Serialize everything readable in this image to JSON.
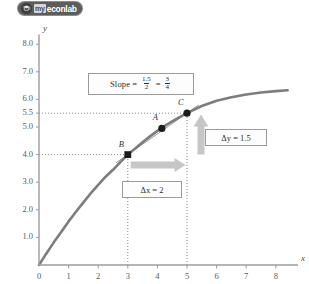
{
  "logo": {
    "icon": "graduation-cap-icon",
    "prefix": "my",
    "name": "econlab"
  },
  "chart_data": {
    "type": "line",
    "title": "",
    "xlabel": "x",
    "ylabel": "y",
    "xlim": [
      0,
      8.6
    ],
    "ylim": [
      0,
      8.4
    ],
    "xticks": [
      "0",
      "1",
      "2",
      "3",
      "4",
      "5",
      "6",
      "7",
      "8"
    ],
    "xtick_values": [
      0,
      1,
      2,
      3,
      4,
      5,
      6,
      7,
      8
    ],
    "yticks": [
      "1.0",
      "2.0",
      "3.0",
      "4.0",
      "5.0",
      "5.5",
      "6.0",
      "7.0",
      "8.0"
    ],
    "ytick_values": [
      1.0,
      2.0,
      3.0,
      4.0,
      5.0,
      5.5,
      6.0,
      7.0,
      8.0
    ],
    "grid": false,
    "curve_color": "#7d7d7d",
    "secant_color": "#9a9a9a",
    "arrow_color": "#c6c6c6",
    "dotted_color": "#8c8c8c",
    "series": [
      {
        "name": "curve",
        "points": [
          [
            0.0,
            0.0
          ],
          [
            0.25,
            0.42
          ],
          [
            0.5,
            0.82
          ],
          [
            0.75,
            1.2
          ],
          [
            1.0,
            1.58
          ],
          [
            1.25,
            1.93
          ],
          [
            1.5,
            2.27
          ],
          [
            1.75,
            2.6
          ],
          [
            2.0,
            2.9
          ],
          [
            2.25,
            3.2
          ],
          [
            2.5,
            3.45
          ],
          [
            2.75,
            3.73
          ],
          [
            3.0,
            4.0
          ],
          [
            3.25,
            4.22
          ],
          [
            3.5,
            4.45
          ],
          [
            3.75,
            4.66
          ],
          [
            4.0,
            4.86
          ],
          [
            4.25,
            5.04
          ],
          [
            4.5,
            5.2
          ],
          [
            4.75,
            5.36
          ],
          [
            5.0,
            5.5
          ],
          [
            5.5,
            5.76
          ],
          [
            6.0,
            5.95
          ],
          [
            6.5,
            6.08
          ],
          [
            7.0,
            6.18
          ],
          [
            7.5,
            6.25
          ],
          [
            8.0,
            6.3
          ],
          [
            8.4,
            6.33
          ]
        ]
      },
      {
        "name": "secant-line-B-to-C",
        "points": [
          [
            2.6,
            3.7
          ],
          [
            5.4,
            5.8
          ]
        ]
      }
    ],
    "annotations": [
      {
        "label": "A",
        "x": 4.15,
        "y": 4.95,
        "marker": "dot"
      },
      {
        "label": "B",
        "x": 3.0,
        "y": 4.0,
        "marker": "square"
      },
      {
        "label": "C",
        "x": 5.0,
        "y": 5.5,
        "marker": "dot"
      }
    ],
    "dashed_guides": [
      {
        "from": [
          0,
          4.0
        ],
        "to": [
          3.0,
          4.0
        ]
      },
      {
        "from": [
          0,
          5.5
        ],
        "to": [
          5.0,
          5.5
        ]
      },
      {
        "from": [
          3.0,
          0
        ],
        "to": [
          3.0,
          4.0
        ]
      },
      {
        "from": [
          5.0,
          0
        ],
        "to": [
          5.0,
          5.5
        ]
      }
    ]
  },
  "callouts": {
    "slope": {
      "label": "Slope",
      "equals1": "=",
      "numerator1": "1.5",
      "denominator1": "2",
      "equals2": "=",
      "numerator2": "3",
      "denominator2": "4"
    },
    "delta_y": "Δy = 1.5",
    "delta_x": "Δx = 2"
  },
  "arrows": {
    "delta_y_arrow": "up-arrow-icon",
    "delta_x_arrow": "right-arrow-icon"
  }
}
